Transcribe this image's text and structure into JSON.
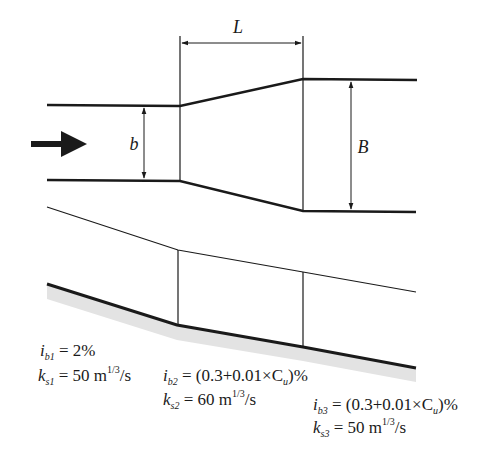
{
  "diagram": {
    "plan_view": {
      "flow_direction_icon": "arrow-right-icon",
      "dimensions": {
        "narrow_width_label": "b",
        "wide_width_label": "B",
        "transition_length_label": "L"
      }
    },
    "profile_view": {
      "reaches": [
        {
          "slope_symbol": "i",
          "slope_sub": "b1",
          "slope_value": " = 2%",
          "roughness_symbol": "k",
          "roughness_sub": "s1",
          "roughness_value": " = 50 m",
          "roughness_exp": "1/3",
          "roughness_unit": "/s"
        },
        {
          "slope_symbol": "i",
          "slope_sub": "b2",
          "slope_value": " = (0.3+0.01×C",
          "slope_var_sub": "u",
          "slope_tail": ")%",
          "roughness_symbol": "k",
          "roughness_sub": "s2",
          "roughness_value": " = 60 m",
          "roughness_exp": "1/3",
          "roughness_unit": "/s"
        },
        {
          "slope_symbol": "i",
          "slope_sub": "b3",
          "slope_value": " = (0.3+0.01×C",
          "slope_var_sub": "u",
          "slope_tail": ")%",
          "roughness_symbol": "k",
          "roughness_sub": "s3",
          "roughness_value": " = 50 m",
          "roughness_exp": "1/3",
          "roughness_unit": "/s"
        }
      ]
    },
    "colors": {
      "line": "#1a1a1a",
      "ground_shade": "#e3e3e3"
    }
  }
}
